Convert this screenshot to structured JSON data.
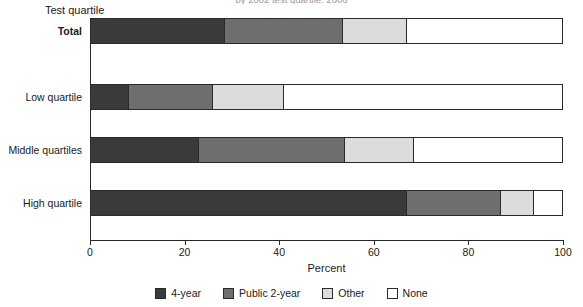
{
  "chart_data": {
    "type": "bar",
    "orientation": "horizontal",
    "stacked": true,
    "normalized": true,
    "title": "by 2002 test quartile: 2006",
    "xlabel": "Percent",
    "ylabel": "Test quartile",
    "xlim": [
      0,
      100
    ],
    "xticks": [
      0,
      20,
      40,
      60,
      80,
      100
    ],
    "xticklabels": [
      "0",
      "20",
      "40",
      "60",
      "80",
      "100"
    ],
    "grid": false,
    "legend_position": "bottom",
    "categories": [
      "Total",
      "Low quartile",
      "Middle quartiles",
      "High quartile"
    ],
    "series": [
      {
        "name": "4-year",
        "color": "#3a3a3a",
        "values": [
          28.5,
          8.0,
          23.0,
          67.0
        ]
      },
      {
        "name": "Public 2-year",
        "color": "#6e6e6e",
        "values": [
          25.0,
          18.0,
          31.0,
          20.0
        ]
      },
      {
        "name": "Other",
        "color": "#dcdcdc",
        "values": [
          13.5,
          15.0,
          14.5,
          7.0
        ]
      },
      {
        "name": "None",
        "color": "#ffffff",
        "values": [
          33.0,
          59.0,
          31.5,
          6.0
        ]
      }
    ]
  },
  "axis": {
    "ylabel": "Test quartile",
    "xlabel": "Percent"
  },
  "legend": {
    "items": [
      {
        "label": "4-year",
        "color": "#3a3a3a"
      },
      {
        "label": "Public 2-year",
        "color": "#6e6e6e"
      },
      {
        "label": "Other",
        "color": "#dcdcdc"
      },
      {
        "label": "None",
        "color": "#ffffff"
      }
    ]
  }
}
